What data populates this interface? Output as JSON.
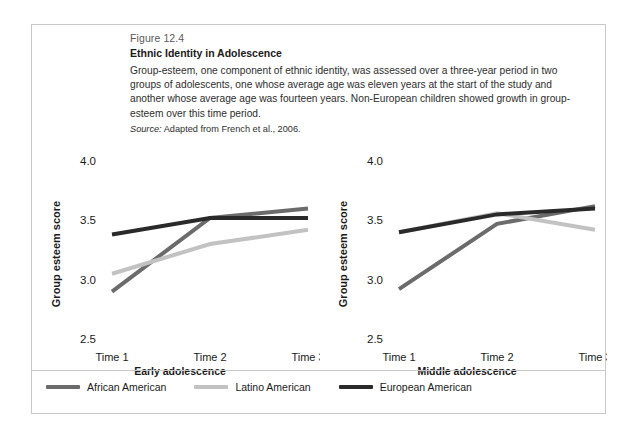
{
  "figure": {
    "number": "Figure 12.4",
    "title": "Ethnic Identity in Adolescence",
    "description": "Group-esteem, one component of ethnic identity, was assessed over a three-year period in two groups of adolescents, one whose average age was eleven years at the start of the study and another whose average age was fourteen years. Non-European children showed growth in group-esteem over this time period.",
    "source_label": "Source:",
    "source_text": "Adapted from French et al., 2006."
  },
  "legend": {
    "items": [
      {
        "label": "African American",
        "color": "#6b6b6b"
      },
      {
        "label": "Latino American",
        "color": "#c2c2c2"
      },
      {
        "label": "European American",
        "color": "#2a2a2a"
      }
    ]
  },
  "chart_data": [
    {
      "type": "line",
      "title": "Early adolescence",
      "xlabel": "",
      "ylabel": "Group esteem score",
      "categories": [
        "Time 1",
        "Time 2",
        "Time 3"
      ],
      "yticks": [
        "2.5",
        "3.0",
        "3.5",
        "4.0"
      ],
      "ylim": [
        2.5,
        4.0
      ],
      "grid": false,
      "legend_position": "bottom",
      "series": [
        {
          "name": "African American",
          "color": "#6b6b6b",
          "values": [
            2.9,
            3.52,
            3.6
          ]
        },
        {
          "name": "Latino American",
          "color": "#c2c2c2",
          "values": [
            3.05,
            3.3,
            3.42
          ]
        },
        {
          "name": "European American",
          "color": "#2a2a2a",
          "values": [
            3.38,
            3.52,
            3.52
          ]
        }
      ]
    },
    {
      "type": "line",
      "title": "Middle adolescence",
      "xlabel": "",
      "ylabel": "Group esteem score",
      "categories": [
        "Time 1",
        "Time 2",
        "Time 3"
      ],
      "yticks": [
        "2.5",
        "3.0",
        "3.5",
        "4.0"
      ],
      "ylim": [
        2.5,
        4.0
      ],
      "grid": false,
      "legend_position": "bottom",
      "series": [
        {
          "name": "African American",
          "color": "#6b6b6b",
          "values": [
            2.92,
            3.47,
            3.62
          ]
        },
        {
          "name": "Latino American",
          "color": "#c2c2c2",
          "values": [
            3.4,
            3.56,
            3.42
          ]
        },
        {
          "name": "European American",
          "color": "#2a2a2a",
          "values": [
            3.4,
            3.55,
            3.6
          ]
        }
      ]
    }
  ]
}
